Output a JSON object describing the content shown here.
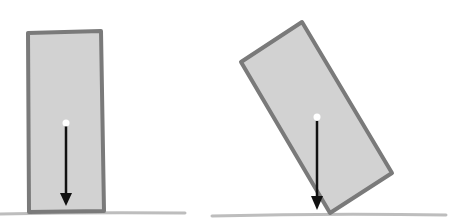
{
  "diagram": {
    "colors": {
      "block_fill": "#d2d2d2",
      "block_stroke": "#7a7a7a",
      "ground": "#bdbdbd",
      "arrow": "#111111",
      "cg_dot": "#ffffff"
    },
    "panels": [
      {
        "name": "upright-block",
        "state": "stable",
        "tilt_deg": 0
      },
      {
        "name": "tilted-block",
        "state": "tipping-point",
        "tilt_deg": 31
      }
    ]
  }
}
